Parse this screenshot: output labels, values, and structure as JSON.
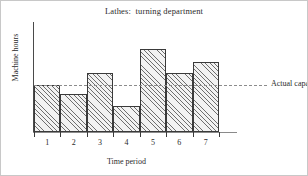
{
  "chart_data": {
    "type": "bar",
    "title": "Lathes:  turning department",
    "xlabel": "Time period",
    "ylabel": "Machine hours",
    "categories": [
      "1",
      "2",
      "3",
      "4",
      "5",
      "6",
      "7"
    ],
    "values": [
      100,
      81,
      126,
      55,
      177,
      126,
      149
    ],
    "ylim": [
      0,
      234
    ],
    "grid": false,
    "legend_position": "right-inline",
    "annotations": [
      {
        "name": "actual-capacity",
        "label": "Actual capacity",
        "type": "horizontal-reference-line",
        "value": 100,
        "style": "dashed",
        "color": "#8c8c8c"
      }
    ],
    "series": [
      {
        "name": "Machine hours",
        "values": [
          100,
          81,
          126,
          55,
          177,
          126,
          149
        ],
        "fill": "hatched-diagonal",
        "edge_color": "#3a3a3a"
      }
    ]
  },
  "colors": {
    "bar_edge": "#3a3a3a",
    "bar_hatch": "#6e6e6e",
    "axis": "#4a4a4a",
    "capacity_line": "#8c8c8c",
    "text": "#2b2b2b",
    "frame": "#c8c8c8",
    "background": "#ffffff"
  }
}
